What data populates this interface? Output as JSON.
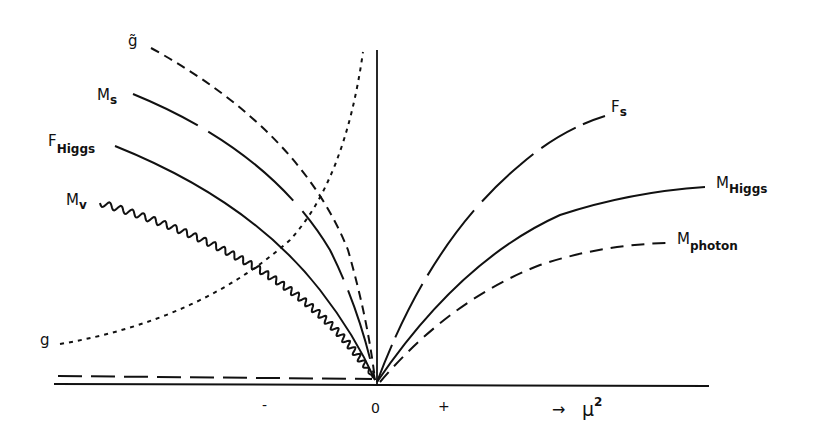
{
  "chart_data": {
    "type": "line",
    "title": "",
    "xlabel": "μ²",
    "xlabel_arrow": "→",
    "ylabel": "",
    "x_tick_labels": [
      "-",
      "0",
      "+"
    ],
    "grid": false,
    "legend": "inline labels at curve ends",
    "region_negative_mu2": [
      {
        "name": "g̃",
        "style": "short-dashed",
        "behavior": "decreases from large value toward 0 at μ²=0"
      },
      {
        "name": "M_s",
        "style": "long-dash (long segments with gaps)",
        "behavior": "decreases toward 0 at μ²=0"
      },
      {
        "name": "F_Higgs",
        "style": "solid",
        "behavior": "decreases toward 0 at μ²=0"
      },
      {
        "name": "M_v",
        "style": "wavy",
        "behavior": "decreases toward 0 at μ²=0"
      },
      {
        "name": "g",
        "style": "dotted",
        "behavior": "increases and diverges as μ²→0⁻"
      },
      {
        "name": "M_photon (μ²<0)",
        "style": "dashed",
        "behavior": "zero / flat along axis"
      }
    ],
    "region_positive_mu2": [
      {
        "name": "F_s",
        "style": "long-dash",
        "behavior": "rises from 0, steepest"
      },
      {
        "name": "M_Higgs",
        "style": "solid",
        "behavior": "rises from 0 and saturates"
      },
      {
        "name": "M_photon",
        "style": "dashed",
        "behavior": "rises from 0 and saturates, lowest"
      }
    ]
  },
  "labels": {
    "g_tilde": "g̃",
    "m_s_main": "M",
    "m_s_sub": "s",
    "f_higgs_main": "F",
    "f_higgs_sub": "Higgs",
    "m_v_main": "M",
    "m_v_sub": "v",
    "g": "g",
    "f_s_main": "F",
    "f_s_sub": "s",
    "m_higgs_main": "M",
    "m_higgs_sub": "Higgs",
    "m_photon_main": "M",
    "m_photon_sub": "photon"
  },
  "axis": {
    "minus": "-",
    "zero": "0",
    "plus": "+",
    "arrow": "→",
    "mu": "μ",
    "mu_exp": "2"
  }
}
